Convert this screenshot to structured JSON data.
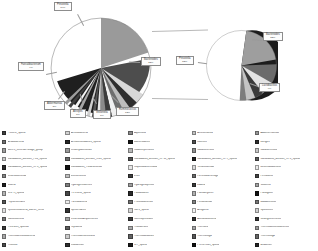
{
  "figure": {
    "type": "pie-of-pie",
    "background": "#ffffff",
    "callout_border": "#8d8d8d"
  },
  "chart_data": [
    {
      "type": "pie",
      "name": "main-pie",
      "title": "",
      "legend_position": "bottom",
      "labels": [
        "Prevotella",
        "Bacteroides",
        "Ruminococcus",
        "Akkermansia",
        "Faecalibacterium",
        "Veillonella",
        "Alistipes",
        "Streptococcus",
        "Fusobacterium",
        "Roseburia",
        "Other"
      ],
      "values": [
        34,
        22,
        12,
        5,
        4,
        3,
        3,
        2,
        2,
        2,
        11
      ],
      "display_percents": [
        "34%",
        "22%",
        "12%",
        "5%",
        "4%",
        "3%",
        "3%",
        "2%",
        "2%",
        "2%",
        "11%"
      ],
      "colors": [
        "#1f1f1f",
        "#9a9a9a",
        "#4d4d4d",
        "#d8d8d8",
        "#2e2e2e",
        "#bdbdbd",
        "#6e6e6e",
        "#f0f0f0",
        "#3c3c3c",
        "#8a8a8a",
        "#5a5a5a"
      ]
    },
    {
      "type": "pie",
      "name": "breakout-pie",
      "title": "",
      "legend_position": "bottom",
      "labels": [
        "Prevotella",
        "Bacteroides",
        "Lactobacillus",
        "Eubacterium",
        "Blautia",
        "Dorea",
        "Other"
      ],
      "values": [
        52,
        22,
        9,
        6,
        4,
        4,
        3
      ],
      "display_percents": [
        "52%",
        "22%",
        "9%",
        "6%",
        "4%",
        "4%",
        "3%"
      ],
      "colors": [
        "#1c1c1c",
        "#9e9e9e",
        "#6b6b6b",
        "#e3e3e3",
        "#3a3a3a",
        "#c4c4c4",
        "#7d7d7d"
      ]
    }
  ],
  "callouts": [
    {
      "id": "prevotella-main",
      "name": "Prevotella",
      "pct": "34%"
    },
    {
      "id": "bacteroides-main",
      "name": "Bacteroides",
      "pct": "22%"
    },
    {
      "id": "ruminococcus-main",
      "name": "Ruminococcus",
      "pct": "12%"
    },
    {
      "id": "akkermansia-main",
      "name": "Akkermansia",
      "pct": "5%"
    },
    {
      "id": "alistipes-main",
      "name": "Alistipes",
      "pct": "3%"
    },
    {
      "id": "veillonella-main",
      "name": "Veillonella",
      "pct": "3%"
    },
    {
      "id": "faecalibact-main",
      "name": "Faecalibacterium",
      "pct": "4%"
    },
    {
      "id": "prevotella-sub",
      "name": "Prevotella",
      "pct": "52%"
    },
    {
      "id": "bacteroides-sub",
      "name": "Bacteroides",
      "pct": "22%"
    },
    {
      "id": "lactobacillus-sub",
      "name": "Lactobacillus",
      "pct": "9%"
    }
  ],
  "legend": {
    "columns": [
      {
        "items": [
          {
            "label": "PC03-2_sponb",
            "color": "#3f3f3f"
          },
          {
            "label": "Acidobacteria",
            "color": "#6f6f6f"
          },
          {
            "label": "BD1-5_incertae-sedge_group",
            "color": "#9e9e9e"
          },
          {
            "label": "Candidatus_division_FCx_sponb",
            "color": "#c9c9c9"
          },
          {
            "label": "Candidatus_division_OP8_sponb",
            "color": "#2a2a2a"
          },
          {
            "label": "Chlorobiomeida",
            "color": "#858585"
          },
          {
            "label": "Cobria",
            "color": "#1e1e1e"
          },
          {
            "label": "GRPR_sponb",
            "color": "#b4b4b4"
          },
          {
            "label": "Peptococcales",
            "color": "#555555"
          },
          {
            "label": "Epsilonrotacteria_bacter_ferito",
            "color": "#e0e0e0"
          },
          {
            "label": "Nafilostomina",
            "color": "#787878"
          },
          {
            "label": "ITLx-B15_sponub",
            "color": "#3a3a3a"
          },
          {
            "label": "Thermodesulfobacteria",
            "color": "#a8a8a8"
          },
          {
            "label": "Thutisile",
            "color": "#4b4b4b"
          }
        ]
      },
      {
        "items": [
          {
            "label": "Actinobacteria",
            "color": "#d2d2d2"
          },
          {
            "label": "Armatimonadetes_sponb",
            "color": "#262626"
          },
          {
            "label": "Chlamydiomonas",
            "color": "#9a9a9a"
          },
          {
            "label": "Candidatus_division_OD1_sponb",
            "color": "#6b6b6b"
          },
          {
            "label": "Candidatus_Tusaromonas",
            "color": "#111111"
          },
          {
            "label": "Deinococcus",
            "color": "#bfbfbf"
          },
          {
            "label": "Hydrogenedentes",
            "color": "#7f7f7f"
          },
          {
            "label": "PL-1-B11_sponb",
            "color": "#474747"
          },
          {
            "label": "Parcubacteria",
            "color": "#ededed"
          },
          {
            "label": "Spirochaetes",
            "color": "#343434"
          },
          {
            "label": "Verbrulia-Acquemicros",
            "color": "#a1a1a1"
          },
          {
            "label": "Tepidiella",
            "color": "#5e5e5e"
          },
          {
            "label": "Thermodesulfovibrio",
            "color": "#cccccc"
          },
          {
            "label": "Cubiantifori",
            "color": "#2f2f2f"
          }
        ]
      },
      {
        "items": [
          {
            "label": "Aquificota",
            "color": "#8b8b8b"
          },
          {
            "label": "Bacteroidetes",
            "color": "#151515"
          },
          {
            "label": "Caldiserpentosis",
            "color": "#b8b8b8"
          },
          {
            "label": "Candidatus_division_OP11_sponb",
            "color": "#525252"
          },
          {
            "label": "Caporobactericaula",
            "color": "#e7e7e7"
          },
          {
            "label": "ENS",
            "color": "#3d3d3d"
          },
          {
            "label": "Hydrogenophilus",
            "color": "#9d9d9d"
          },
          {
            "label": "Paludibacter",
            "color": "#292929"
          },
          {
            "label": "Proteobacterias",
            "color": "#727272"
          },
          {
            "label": "SB-1_sponb",
            "color": "#d6d6d6"
          },
          {
            "label": "Somnophilusom",
            "color": "#404040"
          },
          {
            "label": "Thaliderans",
            "color": "#aeaeae"
          },
          {
            "label": "Thermodikiduses",
            "color": "#636363"
          },
          {
            "label": "WT_sponb",
            "color": "#1a1a1a"
          }
        ]
      },
      {
        "items": [
          {
            "label": "Aminomanila",
            "color": "#c2c2c2"
          },
          {
            "label": "Koenimi",
            "color": "#4e4e4e"
          },
          {
            "label": "Caldiserericos",
            "color": "#8f8f8f"
          },
          {
            "label": "Candidatus_division_OP9_sponb",
            "color": "#202020"
          },
          {
            "label": "Tenibiosomiae",
            "color": "#dadada"
          },
          {
            "label": "Ferretobacteriage",
            "color": "#6a6a6a"
          },
          {
            "label": "Lidaria",
            "color": "#393939"
          },
          {
            "label": "Paeudiflyorier",
            "color": "#b0b0b0"
          },
          {
            "label": "Peridinamae",
            "color": "#818181"
          },
          {
            "label": "Antigomo",
            "color": "#f2f2f2"
          },
          {
            "label": "Acetatubuckena",
            "color": "#313131"
          },
          {
            "label": "Thercara",
            "color": "#a6a6a6"
          },
          {
            "label": "Thermotoga",
            "color": "#575757"
          },
          {
            "label": "PCOE-LdK_sponb",
            "color": "#0f0f0f"
          }
        ]
      },
      {
        "items": [
          {
            "label": "Adalfhermomas",
            "color": "#979797"
          },
          {
            "label": "Loviges",
            "color": "#2d2d2d"
          },
          {
            "label": "Caldisericifoto",
            "color": "#c6c6c6"
          },
          {
            "label": "Candidatus_division_OP8_sponb",
            "color": "#5b5b5b"
          },
          {
            "label": "Deuthidodoviloss",
            "color": "#eaeaea"
          },
          {
            "label": "Firmibanto",
            "color": "#444444"
          },
          {
            "label": "Vokomib",
            "color": "#a3a3a3"
          },
          {
            "label": "Patuligoter",
            "color": "#121212"
          },
          {
            "label": "Bawdosnosis",
            "color": "#767676"
          },
          {
            "label": "Sporoleent",
            "color": "#d0d0d0"
          },
          {
            "label": "Sciangiofteriteros",
            "color": "#363636"
          },
          {
            "label": "Thermodesuftlibacterios",
            "color": "#9b9b9b"
          },
          {
            "label": "Thermotoga",
            "color": "#666666"
          },
          {
            "label": "acadimori",
            "color": "#242424"
          }
        ]
      }
    ]
  }
}
